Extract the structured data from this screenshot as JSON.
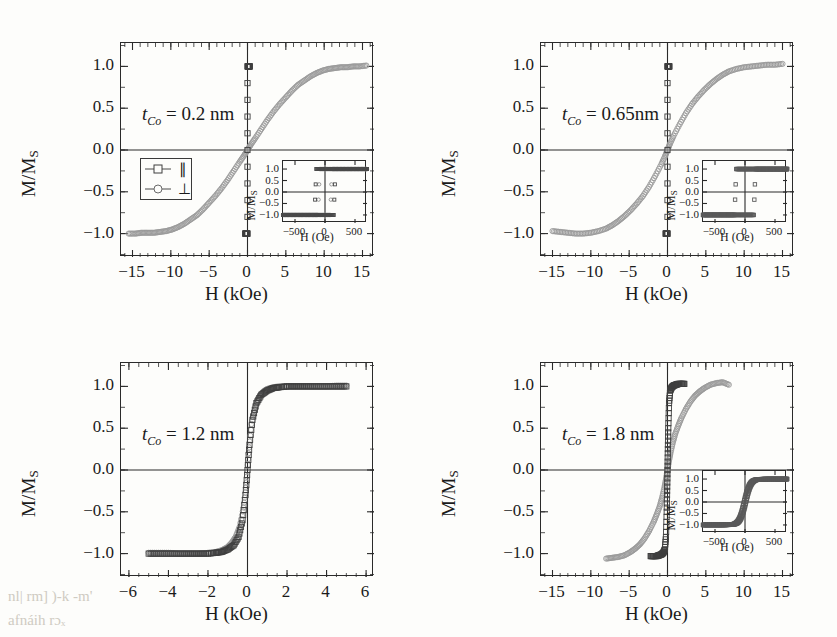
{
  "figure": {
    "background": "#fdfdfb",
    "axis_color": "#2a2a2a",
    "series_colors": {
      "parallel": "#3f3f3f",
      "perpendicular": "#9a9a9a"
    }
  },
  "legend": {
    "parallel_symbol": "square",
    "parallel_label": "∥",
    "perpendicular_symbol": "circle",
    "perpendicular_label": "⊥"
  },
  "axes_common": {
    "ylabel_main": "M/M",
    "ylabel_sub": "S",
    "xlabel_main": "H (kOe)",
    "xlabel_inset": "H (Oe)"
  },
  "ghost_text": {
    "bottom_left_1": "nl| rm] )-k   -m'",
    "bottom_left_2": "afnáih rɔₓ"
  },
  "chart_data": [
    {
      "type": "scatter",
      "panel": "a",
      "title": "",
      "annotation": "t_Co = 0.2 nm",
      "annotation_parts": {
        "t": "t",
        "sub": "Co",
        "rest": " = 0.2 nm"
      },
      "xlabel": "H (kOe)",
      "ylabel": "M/M_S",
      "xlim": [
        -16.5,
        16.5
      ],
      "ylim": [
        -1.28,
        1.28
      ],
      "xticks": [
        -15,
        -10,
        -5,
        0,
        5,
        10,
        15
      ],
      "xticklabels": [
        "−15",
        "−10",
        "−5",
        "0",
        "5",
        "10",
        "15"
      ],
      "yticks": [
        -1.0,
        -0.5,
        0.0,
        0.5,
        1.0
      ],
      "yticklabels": [
        "−1.0",
        "−0.5",
        "0.0",
        "0.5",
        "1.0"
      ],
      "xminor_step": 1,
      "yminor_step": 0.25,
      "grid": false,
      "zero_lines": [
        "x",
        "y"
      ],
      "has_legend": true,
      "has_inset": true,
      "series": [
        {
          "name": "⊥",
          "symbol": "circle",
          "color": "#9a9a9a",
          "description": "hard-axis-like sheared loop, saturating near ±13 kOe",
          "x": [
            -15.5,
            -14.6,
            -13.8,
            -13.0,
            -12.2,
            -11.4,
            -10.6,
            -9.8,
            -9.0,
            -8.2,
            -7.4,
            -6.6,
            -5.8,
            -5.0,
            -4.2,
            -3.4,
            -2.6,
            -1.8,
            -1.0,
            -0.4,
            0.0,
            0.4,
            1.0,
            1.8,
            2.6,
            3.4,
            4.2,
            5.0,
            5.8,
            6.6,
            7.4,
            8.2,
            9.0,
            9.8,
            10.6,
            11.4,
            12.2,
            13.0,
            13.8,
            14.6,
            15.5
          ],
          "y": [
            -1.0,
            -1.0,
            -0.99,
            -0.99,
            -0.99,
            -0.98,
            -0.97,
            -0.95,
            -0.92,
            -0.88,
            -0.83,
            -0.78,
            -0.71,
            -0.63,
            -0.55,
            -0.46,
            -0.36,
            -0.25,
            -0.14,
            -0.06,
            0.0,
            0.06,
            0.14,
            0.25,
            0.36,
            0.46,
            0.55,
            0.63,
            0.71,
            0.78,
            0.83,
            0.88,
            0.92,
            0.95,
            0.97,
            0.98,
            0.99,
            0.99,
            1.0,
            1.0,
            1.01
          ]
        },
        {
          "name": "∥",
          "symbol": "square",
          "color": "#3f3f3f",
          "description": "easy-axis square loop, switches within ±0.3 kOe (vertical at H=0)",
          "x": [
            -0.3,
            -0.15,
            0.0,
            0.0,
            0.0,
            0.15,
            0.3
          ],
          "y": [
            -1.0,
            -1.0,
            -1.0,
            0.0,
            1.0,
            1.0,
            1.0
          ]
        }
      ],
      "inset": {
        "type": "scatter",
        "xlabel": "H (Oe)",
        "ylabel": "M/M_S",
        "xlim": [
          -700,
          700
        ],
        "ylim": [
          -1.35,
          1.35
        ],
        "xticks": [
          -500,
          0,
          500
        ],
        "xticklabels": [
          "−500",
          "0",
          "500"
        ],
        "yticks": [
          -1.0,
          -0.5,
          0.0,
          0.5,
          1.0
        ],
        "yticklabels": [
          "−1.0",
          "−0.5",
          "0.0",
          "0.5",
          "1.0"
        ],
        "description": "open square hysteresis loop with coercive field about ±110 Oe; circles trace the loop, squares lie flat at saturation",
        "coercivity_Oe": 110
      }
    },
    {
      "type": "scatter",
      "panel": "b",
      "annotation": "t_Co = 0.65nm",
      "annotation_parts": {
        "t": "t",
        "sub": "Co",
        "rest": " = 0.65nm"
      },
      "xlabel": "H (kOe)",
      "ylabel": "M/M_S",
      "xlim": [
        -16.5,
        16.5
      ],
      "ylim": [
        -1.28,
        1.28
      ],
      "xticks": [
        -15,
        -10,
        -5,
        0,
        5,
        10,
        15
      ],
      "xticklabels": [
        "−15",
        "−10",
        "−5",
        "0",
        "5",
        "10",
        "15"
      ],
      "yticks": [
        -1.0,
        -0.5,
        0.0,
        0.5,
        1.0
      ],
      "yticklabels": [
        "−1.0",
        "−0.5",
        "0.0",
        "0.5",
        "1.0"
      ],
      "xminor_step": 1,
      "yminor_step": 0.25,
      "grid": false,
      "zero_lines": [
        "x",
        "y"
      ],
      "has_legend": false,
      "has_inset": true,
      "series": [
        {
          "name": "⊥",
          "symbol": "circle",
          "color": "#9a9a9a",
          "description": "sheared loop saturating near ±8 kOe, flatter plateau than panel a",
          "x": [
            -15.0,
            -14.0,
            -13.0,
            -12.0,
            -11.0,
            -10.0,
            -9.0,
            -8.0,
            -7.2,
            -6.4,
            -5.6,
            -4.8,
            -4.0,
            -3.2,
            -2.4,
            -1.6,
            -0.8,
            -0.3,
            0.0,
            0.3,
            0.8,
            1.6,
            2.4,
            3.2,
            4.0,
            4.8,
            5.6,
            6.4,
            7.2,
            8.0,
            9.0,
            10.0,
            11.0,
            12.0,
            13.0,
            14.0,
            15.0
          ],
          "y": [
            -0.97,
            -0.98,
            -0.99,
            -1.0,
            -1.0,
            -0.99,
            -0.97,
            -0.94,
            -0.9,
            -0.85,
            -0.79,
            -0.72,
            -0.64,
            -0.55,
            -0.44,
            -0.31,
            -0.17,
            -0.07,
            0.0,
            0.07,
            0.17,
            0.31,
            0.44,
            0.55,
            0.64,
            0.72,
            0.79,
            0.85,
            0.9,
            0.94,
            0.97,
            0.99,
            1.0,
            1.01,
            1.02,
            1.02,
            1.03
          ]
        },
        {
          "name": "∥",
          "symbol": "square",
          "color": "#3f3f3f",
          "description": "square easy-axis loop switching at H ≈ 0, near-vertical segment",
          "x": [
            -0.25,
            -0.1,
            0.0,
            0.0,
            0.0,
            0.1,
            0.25
          ],
          "y": [
            -1.0,
            -1.0,
            -1.0,
            0.0,
            1.0,
            1.0,
            1.0
          ]
        }
      ],
      "inset": {
        "type": "scatter",
        "xlabel": "H (Oe)",
        "ylabel": "M/M_S",
        "xlim": [
          -700,
          700
        ],
        "ylim": [
          -1.35,
          1.35
        ],
        "xticks": [
          -500,
          0,
          500
        ],
        "xticklabels": [
          "−500",
          "0",
          "500"
        ],
        "yticks": [
          -1.0,
          -0.5,
          0.0,
          0.5,
          1.0
        ],
        "yticklabels": [
          "−1.0",
          "−0.5",
          "0.0",
          "0.5",
          "1.0"
        ],
        "description": "very square hysteresis loop with sharp switching at about ±160 Oe",
        "coercivity_Oe": 160
      }
    },
    {
      "type": "scatter",
      "panel": "c",
      "annotation": "t_Co = 1.2 nm",
      "annotation_parts": {
        "t": "t",
        "sub": "Co",
        "rest": " = 1.2 nm"
      },
      "xlabel": "H (kOe)",
      "ylabel": "M/M_S",
      "xlim": [
        -6.4,
        6.4
      ],
      "ylim": [
        -1.28,
        1.28
      ],
      "xticks": [
        -6,
        -4,
        -2,
        0,
        2,
        4,
        6
      ],
      "xticklabels": [
        "−6",
        "−4",
        "−2",
        "0",
        "2",
        "4",
        "6"
      ],
      "yticks": [
        -1.0,
        -0.5,
        0.0,
        0.5,
        1.0
      ],
      "yticklabels": [
        "−1.0",
        "−0.5",
        "0.0",
        "0.5",
        "1.0"
      ],
      "xminor_step": 0.5,
      "yminor_step": 0.25,
      "grid": false,
      "zero_lines": [
        "x",
        "y"
      ],
      "has_legend": false,
      "has_inset": false,
      "series": [
        {
          "name": "⊥",
          "symbol": "circle",
          "color": "#9a9a9a",
          "description": "steep loop saturating near ±1.5 kOe",
          "x": [
            -5.0,
            -4.5,
            -4.0,
            -3.5,
            -3.0,
            -2.5,
            -2.0,
            -1.6,
            -1.3,
            -1.0,
            -0.8,
            -0.6,
            -0.4,
            -0.2,
            -0.05,
            0.05,
            0.2,
            0.4,
            0.6,
            0.8,
            1.0,
            1.3,
            1.6,
            2.0,
            2.5,
            3.0,
            3.5,
            4.0,
            4.5,
            5.0
          ],
          "y": [
            -0.99,
            -0.99,
            -0.99,
            -1.0,
            -1.0,
            -1.0,
            -0.99,
            -0.98,
            -0.96,
            -0.92,
            -0.87,
            -0.8,
            -0.68,
            -0.45,
            -0.15,
            0.2,
            0.55,
            0.76,
            0.88,
            0.94,
            0.97,
            0.99,
            1.0,
            1.0,
            1.0,
            1.0,
            1.0,
            1.0,
            1.01,
            1.01
          ]
        },
        {
          "name": "∥",
          "symbol": "square",
          "color": "#3f3f3f",
          "description": "slightly narrower loop, saturating near ±1.8 kOe with small hysteresis near zero",
          "x": [
            -5.0,
            -4.5,
            -4.0,
            -3.5,
            -3.0,
            -2.5,
            -2.0,
            -1.6,
            -1.3,
            -1.0,
            -0.7,
            -0.45,
            -0.25,
            -0.1,
            0.0,
            0.1,
            0.25,
            0.45,
            0.7,
            1.0,
            1.3,
            1.6,
            2.0,
            2.5,
            3.0,
            3.5,
            4.0,
            4.5,
            5.0
          ],
          "y": [
            -1.0,
            -1.0,
            -1.0,
            -1.0,
            -1.0,
            -1.0,
            -1.0,
            -0.99,
            -0.98,
            -0.95,
            -0.9,
            -0.8,
            -0.6,
            -0.3,
            0.0,
            0.3,
            0.6,
            0.8,
            0.9,
            0.95,
            0.98,
            0.99,
            1.0,
            1.0,
            1.0,
            1.0,
            1.0,
            1.0,
            1.0
          ]
        }
      ]
    },
    {
      "type": "scatter",
      "panel": "d",
      "annotation": "t_Co = 1.8 nm",
      "annotation_parts": {
        "t": "t",
        "sub": "Co",
        "rest": " = 1.8 nm"
      },
      "xlabel": "H (kOe)",
      "ylabel": "M/M_S",
      "xlim": [
        -16.5,
        16.5
      ],
      "ylim": [
        -1.28,
        1.28
      ],
      "xticks": [
        -15,
        -10,
        -5,
        0,
        5,
        10,
        15
      ],
      "xticklabels": [
        "−15",
        "−10",
        "−5",
        "0",
        "5",
        "10",
        "15"
      ],
      "yticks": [
        -1.0,
        -0.5,
        0.0,
        0.5,
        1.0
      ],
      "yticklabels": [
        "−1.0",
        "−0.5",
        "0.0",
        "0.5",
        "1.0"
      ],
      "xminor_step": 1,
      "yminor_step": 0.25,
      "grid": false,
      "zero_lines": [
        "x",
        "y"
      ],
      "has_legend": false,
      "has_inset": true,
      "series": [
        {
          "name": "⊥",
          "symbol": "circle",
          "color": "#9a9a9a",
          "description": "hard-axis sheared loop saturating near ±8 kOe",
          "x": [
            -8.0,
            -7.2,
            -6.4,
            -5.6,
            -4.8,
            -4.2,
            -3.6,
            -3.0,
            -2.4,
            -1.8,
            -1.4,
            -1.0,
            -0.7,
            -0.4,
            -0.2,
            0.0,
            0.2,
            0.4,
            0.7,
            1.0,
            1.4,
            1.8,
            2.4,
            3.0,
            3.6,
            4.2,
            4.8,
            5.6,
            6.4,
            7.2,
            8.0
          ],
          "y": [
            -1.06,
            -1.05,
            -1.04,
            -1.02,
            -0.98,
            -0.94,
            -0.89,
            -0.82,
            -0.73,
            -0.62,
            -0.53,
            -0.43,
            -0.33,
            -0.21,
            -0.11,
            0.0,
            0.11,
            0.21,
            0.33,
            0.43,
            0.53,
            0.62,
            0.73,
            0.82,
            0.89,
            0.94,
            0.98,
            1.02,
            1.04,
            1.05,
            1.02
          ]
        },
        {
          "name": "∥",
          "symbol": "square",
          "color": "#3f3f3f",
          "description": "easy-axis loop saturating within about ±2 kOe, near-vertical switching at H ≈ 0",
          "x": [
            -2.2,
            -1.8,
            -1.4,
            -1.1,
            -0.8,
            -0.55,
            -0.35,
            -0.2,
            -0.1,
            -0.05,
            0.0,
            0.05,
            0.1,
            0.2,
            0.35,
            0.55,
            0.8,
            1.1,
            1.4,
            1.8,
            2.2
          ],
          "y": [
            -1.03,
            -1.03,
            -1.03,
            -1.02,
            -1.01,
            -0.99,
            -0.95,
            -0.8,
            -0.5,
            -0.25,
            0.0,
            0.25,
            0.5,
            0.8,
            0.95,
            0.99,
            1.01,
            1.02,
            1.03,
            1.03,
            1.03
          ]
        }
      ],
      "inset": {
        "type": "scatter",
        "xlabel": "H (Oe)",
        "ylabel": "M/M_S",
        "xlim": [
          -700,
          700
        ],
        "ylim": [
          -1.35,
          1.35
        ],
        "xticks": [
          -500,
          0,
          500
        ],
        "xticklabels": [
          "−500",
          "0",
          "500"
        ],
        "yticks": [
          -1.0,
          -0.5,
          0.0,
          0.5,
          1.0
        ],
        "yticklabels": [
          "−1.0",
          "−0.5",
          "0.0",
          "0.5",
          "1.0"
        ],
        "description": "narrow almost anhysteretic loop, steep rise through zero field saturating by about 200 Oe",
        "coercivity_Oe": 20
      }
    }
  ]
}
